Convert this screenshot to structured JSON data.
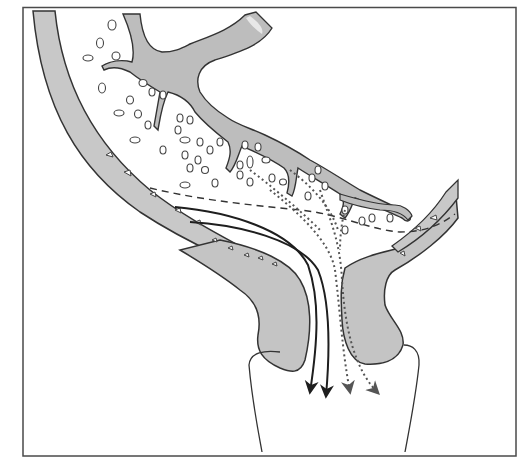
{
  "diagram": {
    "type": "anatomical-cross-section",
    "labels": [],
    "colors": {
      "background": "#ffffff",
      "frame": "#4a4a4a",
      "tissue_fill": "#c2c2c2",
      "tissue_fill_light": "#d4d4d4",
      "outline": "#333333",
      "solid_arrow": "#1e1e1e",
      "dotted_arrow": "#555555",
      "dashed_line": "#333333"
    },
    "frame": {
      "x": 23,
      "y": 7,
      "width": 493,
      "height": 449
    },
    "flows": {
      "solid_arrows": 2,
      "dotted_arrows": 2,
      "arrow_direction": "down"
    },
    "regions": [
      "outer-curved-wall",
      "spongy-meshwork",
      "branching-tissue",
      "left-lobe",
      "right-lobe",
      "lower-channel",
      "right-wall"
    ]
  }
}
